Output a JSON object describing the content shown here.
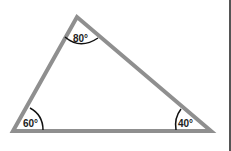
{
  "diagram": {
    "type": "triangle",
    "stroke_color": "#8f8f8f",
    "arc_color": "#111111",
    "border_color": "#555555",
    "vertices": {
      "top": {
        "x": 77,
        "y": 17,
        "angle_label": "80°"
      },
      "bottom_left": {
        "x": 13,
        "y": 131,
        "angle_label": "60°"
      },
      "bottom_right": {
        "x": 211,
        "y": 131,
        "angle_label": "40°"
      }
    }
  }
}
